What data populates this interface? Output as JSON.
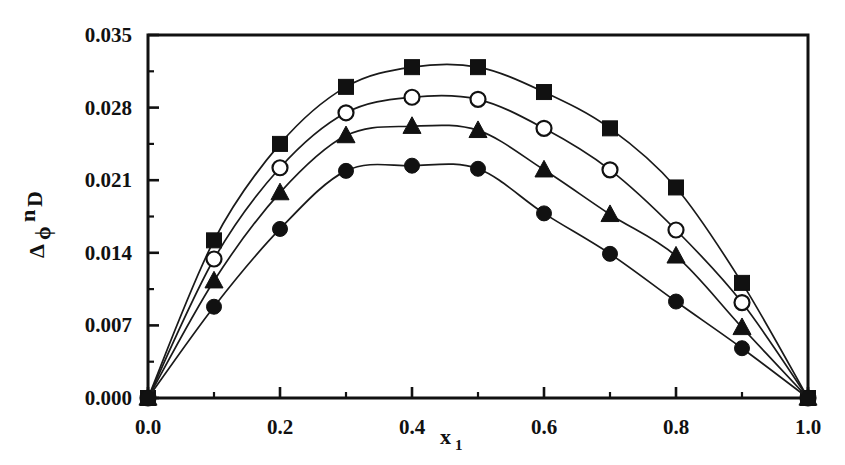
{
  "chart_data": {
    "type": "line",
    "title": "",
    "xlabel": "x1",
    "ylabel": "Δ ϕ nD",
    "ylabel_parts": {
      "delta": "Δ",
      "phi": "ϕ",
      "n": "n",
      "D": "D"
    },
    "xlabel_parts": {
      "base": "x",
      "sub": "1"
    },
    "xlim": [
      0.0,
      1.0
    ],
    "ylim": [
      0.0,
      0.035
    ],
    "xticks": [
      0.0,
      0.2,
      0.4,
      0.6,
      0.8,
      1.0
    ],
    "xtick_labels": [
      "0.0",
      "0.2",
      "0.4",
      "0.6",
      "0.8",
      "1.0"
    ],
    "xticks_minor": [
      0.1,
      0.3,
      0.5,
      0.7,
      0.9
    ],
    "yticks": [
      0.0,
      0.007,
      0.014,
      0.021,
      0.028,
      0.035
    ],
    "ytick_labels": [
      "0.000",
      "0.007",
      "0.014",
      "0.021",
      "0.028",
      "0.035"
    ],
    "yticks_minor": [
      0.0035,
      0.0105,
      0.0175,
      0.0245,
      0.0315
    ],
    "grid": false,
    "legend_position": "none",
    "x": [
      0.0,
      0.1,
      0.2,
      0.3,
      0.4,
      0.5,
      0.6,
      0.7,
      0.8,
      0.9,
      1.0
    ],
    "series": [
      {
        "name": "series-1",
        "marker": "filled-square",
        "values": [
          0.0,
          0.0152,
          0.0245,
          0.03,
          0.0319,
          0.0319,
          0.0295,
          0.026,
          0.0203,
          0.0111,
          0.0
        ]
      },
      {
        "name": "series-2",
        "marker": "open-circle",
        "values": [
          0.0,
          0.0134,
          0.0222,
          0.0275,
          0.029,
          0.0288,
          0.026,
          0.022,
          0.0162,
          0.0092,
          0.0
        ]
      },
      {
        "name": "series-3",
        "marker": "filled-triangle",
        "values": [
          0.0,
          0.0113,
          0.0198,
          0.0253,
          0.0262,
          0.0258,
          0.022,
          0.0177,
          0.0137,
          0.0068,
          0.0
        ]
      },
      {
        "name": "series-4",
        "marker": "filled-circle",
        "values": [
          0.0,
          0.0088,
          0.0163,
          0.0219,
          0.0224,
          0.0221,
          0.0178,
          0.0139,
          0.0093,
          0.0048,
          0.0
        ]
      }
    ],
    "colors": {
      "axis": "#111111",
      "curve": "#1a1a1a",
      "marker_fill": "#111111",
      "marker_open_fill": "#ffffff",
      "background": "#ffffff"
    }
  }
}
